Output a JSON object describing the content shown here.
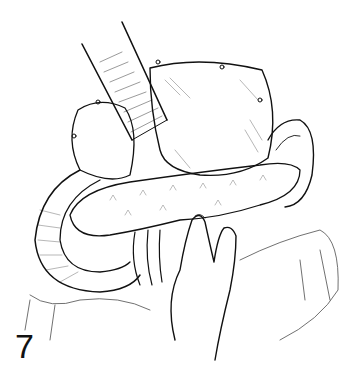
{
  "figure": {
    "number": "7",
    "colors": {
      "background": "#ffffff",
      "ink": "#111111"
    }
  }
}
